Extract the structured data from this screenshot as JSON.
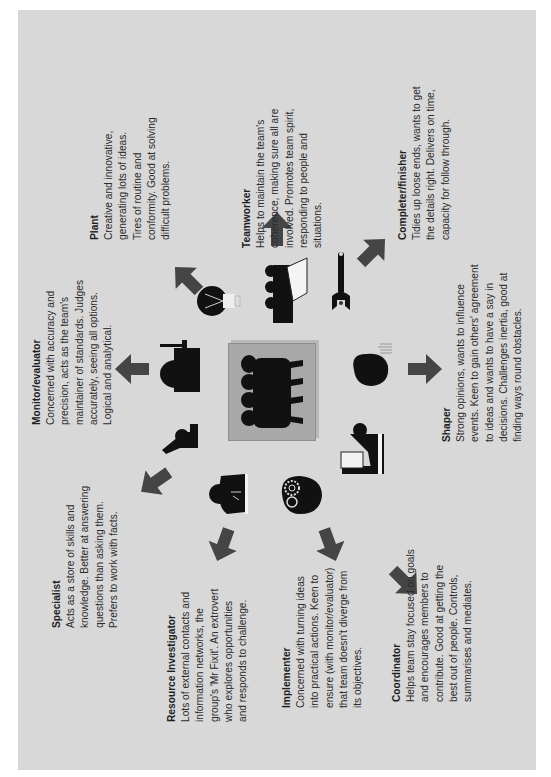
{
  "diagram": {
    "background_color": "#d8d8d8",
    "arrow_color": "#454545",
    "center": {
      "icon": "team-group-icon",
      "box_color": "#a8a8a8"
    },
    "roles": [
      {
        "id": "monitor-evaluator",
        "title": "Monitor/evaluator",
        "icon": "judge-with-gavel-icon",
        "description": "Concerned with accuracy and\nprecision, acts as the team's\nmaintainer of standards. Judges\naccurately, seeing all options.\nLogical and analytical."
      },
      {
        "id": "plant",
        "title": "Plant",
        "icon": "lightbulb-icon",
        "description": "Creative and innovative,\ngenerating lots of ideas.\nTires of routine and\nconformity. Good at solving\ndifficult problems."
      },
      {
        "id": "teamworker",
        "title": "Teamworker",
        "icon": "group-at-flipchart-icon",
        "description": "Helps to maintain the team's\ncoherence, making sure all are\ninvolved. Promotes team spirit,\nresponding to people and\nsituations."
      },
      {
        "id": "completer-finisher",
        "title": "Completer/finisher",
        "icon": "wrench-icon",
        "description": "Tidies up loose ends, wants to get\nthe details right. Delivers on time,\ncapacity for follow through."
      },
      {
        "id": "shaper",
        "title": "Shaper",
        "icon": "head-with-signal-icon",
        "description": "Strong opinions, wants to influence\nevents. Keen to gain others' agreement\nto ideas and wants to have a say in\ndecisions. Challenges inertia, good at\nfinding ways round obstacles."
      },
      {
        "id": "coordinator",
        "title": "Coordinator",
        "icon": "presenter-at-board-icon",
        "description": "Helps team stay focused on goals\nand encourages members to\ncontribute. Good at getting the\nbest out of people. Controls,\nsummarises and mediates."
      },
      {
        "id": "implementer",
        "title": "Implementer",
        "icon": "head-with-gears-icon",
        "description": "Concerned with turning ideas\ninto practical actions. Keen to\nensure (with monitor/evaluator)\nthat team doesn't diverge from\nits objectives."
      },
      {
        "id": "resource-investigator",
        "title": "Resource Investigator",
        "icon": "person-at-desk-phone-icon",
        "description": "Lots of external contacts and\ninformation networks, the\ngroup's 'Mr Fixit'. An extrovert\nwho explores opportunities\nand responds to challenge."
      },
      {
        "id": "specialist",
        "title": "Specialist",
        "icon": "person-with-microscope-icon",
        "description": "Acts as a store of skills and\nknowledge. Better at answering\nquestions than asking them.\nPrefers to work with facts."
      }
    ]
  }
}
